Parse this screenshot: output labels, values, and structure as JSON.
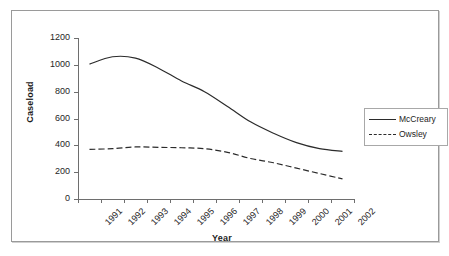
{
  "chart_data": {
    "type": "line",
    "title": "",
    "xlabel": "Year",
    "ylabel": "Caseload",
    "categories": [
      "1991",
      "1992",
      "1993",
      "1994",
      "1995",
      "1996",
      "1997",
      "1998",
      "1999",
      "2000",
      "2001",
      "2002"
    ],
    "yticks": [
      0,
      200,
      400,
      600,
      800,
      1000,
      1200
    ],
    "ylim": [
      0,
      1200
    ],
    "grid": false,
    "legend_position": "right",
    "series": [
      {
        "name": "McCreary",
        "style": "solid",
        "color": "#2b2b2b",
        "values": [
          1005,
          1060,
          1050,
          975,
          880,
          800,
          690,
          575,
          490,
          420,
          375,
          355
        ]
      },
      {
        "name": "Owsley",
        "style": "dashed",
        "color": "#2b2b2b",
        "values": [
          370,
          375,
          388,
          385,
          382,
          375,
          348,
          302,
          270,
          230,
          190,
          150
        ]
      }
    ]
  },
  "legend": {
    "items": [
      {
        "label": "McCreary"
      },
      {
        "label": "Owsley"
      }
    ]
  }
}
